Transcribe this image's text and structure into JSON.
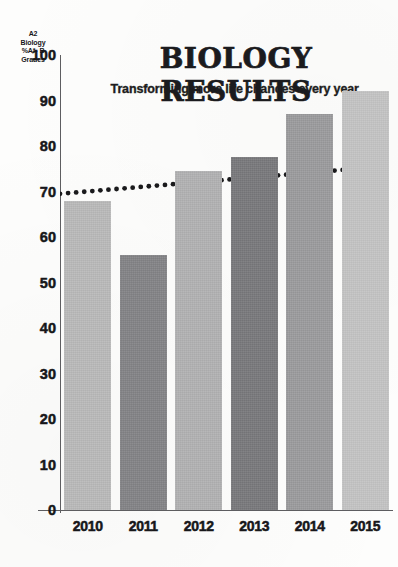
{
  "chart_data": {
    "type": "bar",
    "title": "BIOLOGY RESULTS",
    "subtitle": "Transforming more life chances every year.",
    "ylabel_lines": [
      "A2",
      "Biology",
      "%A*- B",
      "Grades"
    ],
    "ylabel": "A2 Biology %A*- B Grades",
    "xlabel": "",
    "categories": [
      "2010",
      "2011",
      "2012",
      "2013",
      "2014",
      "2015"
    ],
    "values": [
      68,
      56,
      74.5,
      77.5,
      87,
      92
    ],
    "ylim": [
      0,
      100
    ],
    "yticks": [
      0,
      10,
      20,
      30,
      40,
      50,
      60,
      70,
      80,
      90,
      100
    ],
    "ytick_labels": [
      "0",
      "10",
      "20",
      "30",
      "40",
      "50",
      "60",
      "70",
      "80",
      "90",
      "100"
    ],
    "grid": false,
    "legend": "none",
    "bar_colors": [
      "#b9b9b9",
      "#828285",
      "#b0b0b1",
      "#77777a",
      "#9a9a9c",
      "#c3c3c3"
    ],
    "annotations": [
      {
        "name": "trendline",
        "style": "dotted",
        "color": "#1a1a1c",
        "start": {
          "x": "2010",
          "y": 69.5
        },
        "end": {
          "x": "2015",
          "y": 75.5
        }
      }
    ]
  }
}
